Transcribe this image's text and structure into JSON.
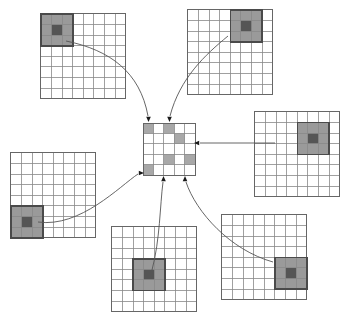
{
  "figure": {
    "type": "diagram",
    "canvas": {
      "width": 342,
      "height": 313
    },
    "background_color": "#ffffff"
  },
  "colors": {
    "grid_line": "#888888",
    "grid_border": "#666666",
    "patch_fill": "#9a9a9a",
    "patch_center_fill": "#555555",
    "patch_border": "#4a4a4a",
    "center_cell_fill": "#a8a8a8",
    "arrow_stroke": "#555555",
    "arrow_head": "#1a1a1a"
  },
  "center_grid": {
    "name": "central-feature-map",
    "rows": 5,
    "cols": 5,
    "x": 143,
    "y": 123,
    "cell": 10.4,
    "shaded_cells": [
      {
        "row": 0,
        "col": 0
      },
      {
        "row": 0,
        "col": 2
      },
      {
        "row": 1,
        "col": 3
      },
      {
        "row": 3,
        "col": 2
      },
      {
        "row": 3,
        "col": 4
      },
      {
        "row": 4,
        "col": 0
      }
    ]
  },
  "outer_grids": [
    {
      "name": "grid-top-left",
      "rows": 8,
      "cols": 8,
      "x": 41,
      "y": 14,
      "cell": 10.6,
      "patch": {
        "row": 0,
        "col": 0,
        "size": 3
      },
      "center": {
        "row": 1,
        "col": 1
      }
    },
    {
      "name": "grid-top-right",
      "rows": 8,
      "cols": 8,
      "x": 188,
      "y": 10,
      "cell": 10.6,
      "patch": {
        "row": 0,
        "col": 4,
        "size": 3
      },
      "center": {
        "row": 1,
        "col": 5
      }
    },
    {
      "name": "grid-right",
      "rows": 8,
      "cols": 8,
      "x": 255,
      "y": 112,
      "cell": 10.6,
      "patch": {
        "row": 1,
        "col": 4,
        "size": 3
      },
      "center": {
        "row": 2,
        "col": 5
      }
    },
    {
      "name": "grid-left",
      "rows": 8,
      "cols": 8,
      "x": 11,
      "y": 153,
      "cell": 10.6,
      "patch": {
        "row": 5,
        "col": 0,
        "size": 3
      },
      "center": {
        "row": 6,
        "col": 1
      }
    },
    {
      "name": "grid-bottom-center",
      "rows": 8,
      "cols": 8,
      "x": 112,
      "y": 227,
      "cell": 10.6,
      "patch": {
        "row": 3,
        "col": 2,
        "size": 3
      },
      "center": {
        "row": 4,
        "col": 3
      }
    },
    {
      "name": "grid-bottom-right",
      "rows": 8,
      "cols": 8,
      "x": 222,
      "y": 215,
      "cell": 10.6,
      "patch": {
        "row": 4,
        "col": 5,
        "size": 3
      },
      "center": {
        "row": 5,
        "col": 6
      }
    }
  ],
  "arrows": [
    {
      "name": "arrow-from-top-left",
      "from_grid": "grid-top-left",
      "to_cell": {
        "row": 0,
        "col": 0
      },
      "path": "M 66 41 C 110 50 140 72 148 116",
      "head": {
        "x": 148.5,
        "y": 122,
        "dir": "down"
      }
    },
    {
      "name": "arrow-from-top-right",
      "from_grid": "grid-top-right",
      "to_cell": {
        "row": 0,
        "col": 2
      },
      "path": "M 228 36 C 205 55 180 78 170 116",
      "head": {
        "x": 169.5,
        "y": 122,
        "dir": "down"
      }
    },
    {
      "name": "arrow-from-right",
      "from_grid": "grid-right",
      "to_cell": {
        "row": 1,
        "col": 3
      },
      "path": "M 275 143 L 200 143",
      "head": {
        "x": 194,
        "y": 143,
        "dir": "left"
      }
    },
    {
      "name": "arrow-from-left",
      "from_grid": "grid-left",
      "to_cell": {
        "row": 4,
        "col": 0
      },
      "path": "M 38 222 C 80 228 120 186 138 174",
      "head": {
        "x": 144,
        "y": 173,
        "dir": "right"
      }
    },
    {
      "name": "arrow-from-bottom-center",
      "from_grid": "grid-bottom-center",
      "to_cell": {
        "row": 3,
        "col": 2
      },
      "path": "M 152 270 C 160 240 160 205 163 182",
      "head": {
        "x": 163.5,
        "y": 176,
        "dir": "up"
      }
    },
    {
      "name": "arrow-from-bottom-right",
      "from_grid": "grid-bottom-right",
      "to_cell": {
        "row": 3,
        "col": 4
      },
      "path": "M 273 262 C 230 250 196 212 186 182",
      "head": {
        "x": 185,
        "y": 176,
        "dir": "up"
      }
    }
  ]
}
